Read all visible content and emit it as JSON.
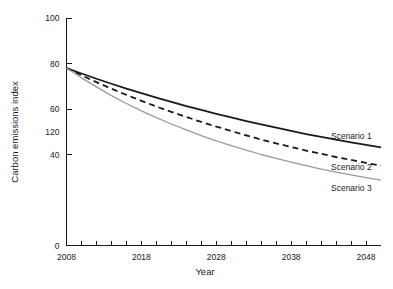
{
  "chart_data": {
    "type": "line",
    "title": "",
    "xlabel": "Year",
    "ylabel": "Carbon emissions index",
    "xlim": [
      2008,
      2050
    ],
    "ylim": [
      0,
      100
    ],
    "grid": false,
    "legend_position": "right-inline",
    "x_ticks_major": [
      2008,
      2018,
      2028,
      2038,
      2048
    ],
    "x_tick_labels": [
      "2008",
      "2018",
      "2028",
      "2038",
      "2048"
    ],
    "x_ticks_minor": [
      2010,
      2012,
      2014,
      2016,
      2020,
      2022,
      2024,
      2026,
      2030,
      2032,
      2034,
      2036,
      2040,
      2042,
      2044,
      2046
    ],
    "y_ticks": [
      0,
      40,
      60,
      80,
      100
    ],
    "y_tick_labels": [
      "0",
      "40",
      "120",
      "60",
      "80",
      "100"
    ],
    "y_tick_label_values": [
      0,
      40,
      50,
      60,
      80,
      100
    ],
    "x": [
      2008,
      2010,
      2012,
      2014,
      2016,
      2018,
      2020,
      2022,
      2024,
      2026,
      2028,
      2030,
      2032,
      2034,
      2036,
      2038,
      2040,
      2042,
      2044,
      2046,
      2048,
      2050
    ],
    "series": [
      {
        "name": "Scenario 1",
        "style": "solid",
        "color": "#1a1a1a",
        "width": 1.8,
        "values": [
          78.0,
          75.6,
          73.3,
          71.1,
          69.0,
          67.0,
          65.0,
          63.1,
          61.3,
          59.6,
          57.9,
          56.3,
          54.7,
          53.2,
          51.8,
          50.4,
          49.0,
          47.7,
          46.5,
          45.3,
          44.2,
          43.1
        ]
      },
      {
        "name": "Scenario 2",
        "style": "dashed",
        "color": "#1a1a1a",
        "width": 1.8,
        "values": [
          78.0,
          74.8,
          71.8,
          68.9,
          66.2,
          63.6,
          61.1,
          58.7,
          56.5,
          54.3,
          52.3,
          50.3,
          48.4,
          46.6,
          44.9,
          43.3,
          41.7,
          40.3,
          38.9,
          37.6,
          36.3,
          35.1
        ]
      },
      {
        "name": "Scenario 3",
        "style": "solid",
        "color": "#9a9a9a",
        "width": 1.3,
        "values": [
          78.0,
          73.7,
          69.7,
          65.9,
          62.4,
          59.2,
          56.2,
          53.4,
          50.8,
          48.3,
          46.0,
          43.9,
          41.9,
          40.0,
          38.3,
          36.6,
          35.1,
          33.6,
          32.3,
          31.0,
          29.8,
          28.7
        ]
      }
    ],
    "annotations": [
      {
        "text": "Scenario 1",
        "x": 2050,
        "y": 47
      },
      {
        "text": "Scenario 2",
        "x": 2050,
        "y": 33
      },
      {
        "text": "Scenario 3",
        "x": 2050,
        "y": 24
      }
    ]
  },
  "axes": {
    "x_title": "Year",
    "y_title": "Carbon emissions index"
  },
  "colors": {
    "series_1": "#1a1a1a",
    "series_2": "#1a1a1a",
    "series_3": "#9a9a9a",
    "axis": "#1a1a1a",
    "background": "#ffffff"
  }
}
